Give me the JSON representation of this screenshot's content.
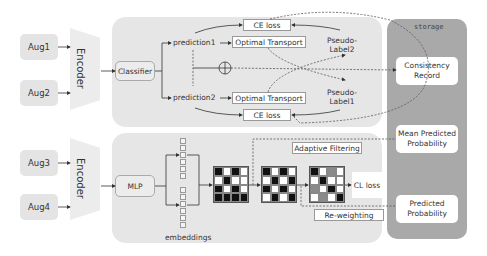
{
  "augmentations": [
    {
      "label": "Aug1"
    },
    {
      "label": "Aug2"
    },
    {
      "label": "Aug3"
    },
    {
      "label": "Aug4"
    }
  ],
  "encoders": [
    {
      "label": "Encoder"
    },
    {
      "label": "Encoder"
    }
  ],
  "top_branch": {
    "classifier": "Classifier",
    "prediction1": "prediction1",
    "prediction2": "prediction2",
    "optimal_transport_1": "Optimal Transport",
    "optimal_transport_2": "Optimal Transport",
    "ce_loss_1": "CE loss",
    "ce_loss_2": "CE loss",
    "pseudo_label2": [
      "Pseudo-",
      "Label2"
    ],
    "pseudo_label1": [
      "Pseudo-",
      "Label1"
    ],
    "combine_symbol": "⊕"
  },
  "bottom_branch": {
    "mlp": "MLP",
    "embeddings": "embeddings",
    "adaptive_filtering": "Adaptive Filtering",
    "re_weighting": "Re-weighting",
    "cl_loss": "CL loss",
    "grids": [
      {
        "name": "similarity-matrix",
        "cells": [
          "B",
          "W",
          "B",
          "W",
          "W",
          "B",
          "W",
          "W",
          "B",
          "W",
          "B",
          "W",
          "B",
          "B",
          "B",
          "B"
        ]
      },
      {
        "name": "filtered-matrix",
        "cells": [
          "B",
          "W",
          "B",
          "W",
          "W",
          "B",
          "W",
          "B",
          "B",
          "W",
          "B",
          "W",
          "W",
          "B",
          "W",
          "B"
        ]
      },
      {
        "name": "reweighted-matrix",
        "cells": [
          "B",
          "W",
          "G",
          "W",
          "W",
          "B",
          "W",
          "W",
          "G",
          "W",
          "B",
          "W",
          "W",
          "G",
          "W",
          "B"
        ]
      }
    ]
  },
  "storage": {
    "title": "storage",
    "items": [
      {
        "label": "Consistency Record"
      },
      {
        "label": "Mean Predicted Probability"
      },
      {
        "label": "Predicted Probability"
      }
    ]
  }
}
